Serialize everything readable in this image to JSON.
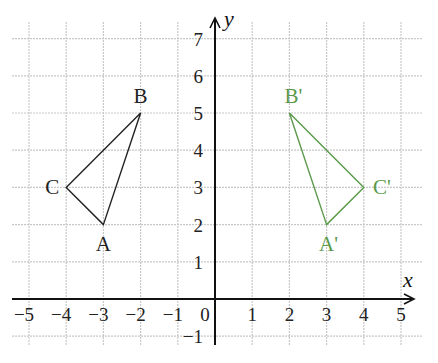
{
  "diagram": {
    "type": "coordinate-grid-reflection",
    "axes": {
      "x_label": "x",
      "y_label": "y",
      "origin_label": "0",
      "x_ticks": [
        "−5",
        "−4",
        "−3",
        "−2",
        "−1",
        "1",
        "2",
        "3",
        "4",
        "5"
      ],
      "x_tick_values": [
        -5,
        -4,
        -3,
        -2,
        -1,
        1,
        2,
        3,
        4,
        5
      ],
      "y_ticks": [
        "−1",
        "1",
        "2",
        "3",
        "4",
        "5",
        "6",
        "7"
      ],
      "y_tick_values": [
        -1,
        1,
        2,
        3,
        4,
        5,
        6,
        7
      ],
      "x_range": [
        -5.5,
        5.5
      ],
      "y_range": [
        -1.2,
        7.5
      ]
    },
    "grid": {
      "visible": true,
      "color": "#c8c8c8"
    },
    "shapes": [
      {
        "name": "original-triangle",
        "color": "#222222",
        "vertices": [
          {
            "label": "A",
            "x": -3,
            "y": 2
          },
          {
            "label": "B",
            "x": -2,
            "y": 5
          },
          {
            "label": "C",
            "x": -4,
            "y": 3
          }
        ]
      },
      {
        "name": "reflected-triangle",
        "color": "#5a9a4a",
        "vertices": [
          {
            "label": "A'",
            "x": 3,
            "y": 2
          },
          {
            "label": "B'",
            "x": 2,
            "y": 5
          },
          {
            "label": "C'",
            "x": 4,
            "y": 3
          }
        ]
      }
    ]
  },
  "colors": {
    "axis": "#111111",
    "grid": "#c8c8c8",
    "original": "#222222",
    "image": "#5a9a4a",
    "tick_text": "#222222"
  }
}
